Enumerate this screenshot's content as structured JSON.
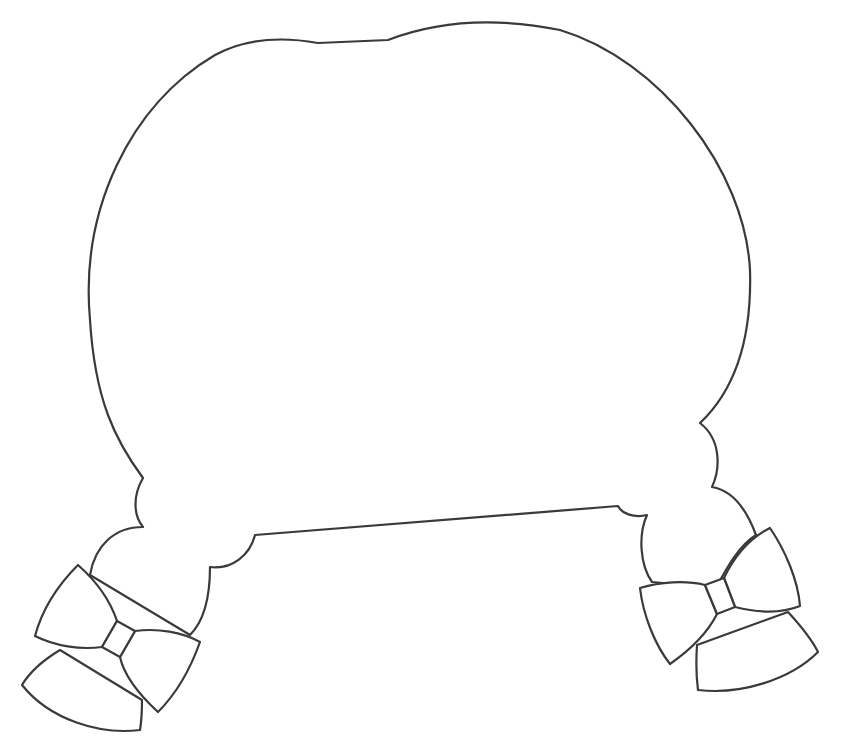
{
  "illustration": {
    "title": "Hair outline with pigtails and bows",
    "background_color": "#ffffff",
    "stroke_color": "#3a3a3a",
    "parts": [
      {
        "id": "head-outline",
        "label": "Hair / head outline"
      },
      {
        "id": "left-pigtail",
        "label": "Left pigtail"
      },
      {
        "id": "right-pigtail",
        "label": "Right pigtail"
      },
      {
        "id": "left-bow",
        "label": "Left bow"
      },
      {
        "id": "right-bow",
        "label": "Right bow"
      }
    ]
  }
}
